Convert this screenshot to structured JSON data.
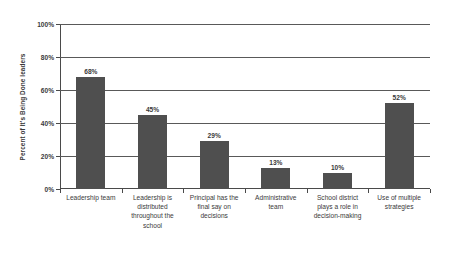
{
  "chart_data": {
    "type": "bar",
    "title": "",
    "xlabel": "",
    "ylabel": "Percent of It's Being Done leaders",
    "ylim": [
      0,
      100
    ],
    "ytick_labels": [
      "0%",
      "20%",
      "40%",
      "60%",
      "80%",
      "100%"
    ],
    "ytick_values": [
      0,
      20,
      40,
      60,
      80,
      100
    ],
    "grid": true,
    "legend": false,
    "bar_color": "#4f4f4f",
    "categories": [
      "Leadership team",
      "Leadership is distributed throughout the school",
      "Principal has the final say on decisions",
      "Administrative team",
      "School district plays a role in decision-making",
      "Use of multiple strategies"
    ],
    "values": [
      68,
      45,
      29,
      13,
      10,
      52
    ],
    "value_labels": [
      "68%",
      "45%",
      "29%",
      "13%",
      "10%",
      "52%"
    ]
  }
}
